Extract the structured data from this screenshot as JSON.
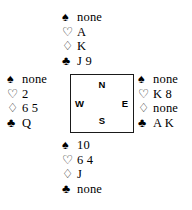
{
  "diagram": {
    "type": "bridge-hand-diagram",
    "suit_symbols": {
      "spade": "♠",
      "heart": "♡",
      "diamond": "♢",
      "club": "♣"
    },
    "colors": {
      "ink": "#000000",
      "border": "#1a1a1a",
      "background": "#ffffff"
    }
  },
  "compass": {
    "north": "N",
    "south": "S",
    "west": "W",
    "east": "E"
  },
  "hands": {
    "north": {
      "position": "North",
      "spades": "none",
      "hearts": "A",
      "diamonds": "K",
      "clubs": "J 9"
    },
    "west": {
      "position": "West",
      "spades": "none",
      "hearts": "2",
      "diamonds": "6 5",
      "clubs": "Q"
    },
    "east": {
      "position": "East",
      "spades": "none",
      "hearts": "K 8",
      "diamonds": "none",
      "clubs": "A K"
    },
    "south": {
      "position": "South",
      "spades": "10",
      "hearts": "6 4",
      "diamonds": "J",
      "clubs": "none"
    }
  }
}
